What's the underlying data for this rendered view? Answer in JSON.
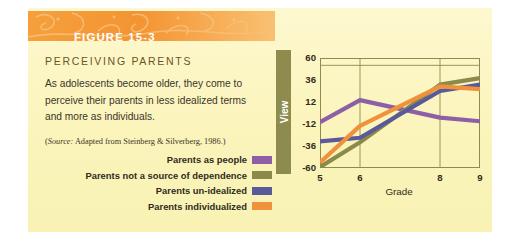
{
  "figure": {
    "banner_label": "FIGURE 15-3",
    "headline": "PERCEIVING PARENTS",
    "body": "As adolescents become older, they come to perceive their parents in less idealized terms and more as individuals.",
    "source_prefix": "(",
    "source_italic": "Source:",
    "source_rest": " Adapted from Steinberg & Silverberg, 1986.)"
  },
  "legend": {
    "items": [
      {
        "label": "Parents as people",
        "color": "#8e5fa6"
      },
      {
        "label": "Parents not a source of dependence",
        "color": "#8a8a4a"
      },
      {
        "label": "Parents un-idealized",
        "color": "#59599c"
      },
      {
        "label": "Parents individualized",
        "color": "#f0913c"
      }
    ]
  },
  "chart_data": {
    "type": "line",
    "title": "",
    "xlabel": "Grade",
    "ylabel": "View",
    "categories": [
      "5",
      "6",
      "8",
      "9"
    ],
    "x": [
      5,
      6,
      8,
      9
    ],
    "xtick_labels": [
      "5",
      "6",
      "8",
      "9"
    ],
    "ytick_labels": [
      "60",
      "36",
      "12",
      "-12",
      "-36",
      "-60"
    ],
    "yticks": [
      60,
      36,
      12,
      -12,
      -36,
      -60
    ],
    "ylim": [
      -60,
      60
    ],
    "grid": "vertical",
    "legend_position": "left-outside",
    "series": [
      {
        "name": "Parents as people",
        "color": "#8e5fa6",
        "values": [
          -10,
          14,
          -5,
          -9
        ]
      },
      {
        "name": "Parents not a source of dependence",
        "color": "#8a8a4a",
        "values": [
          -59,
          -32,
          31,
          38
        ]
      },
      {
        "name": "Parents un-idealized",
        "color": "#59599c",
        "values": [
          -31,
          -27,
          24,
          31
        ]
      },
      {
        "name": "Parents individualized",
        "color": "#f0913c",
        "values": [
          -54,
          -14,
          29,
          26
        ]
      }
    ]
  }
}
